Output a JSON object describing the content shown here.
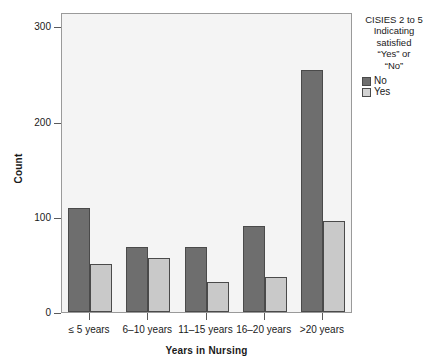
{
  "chart_data": {
    "type": "bar",
    "title": "",
    "categories": [
      "≤ 5 years",
      "6–10 years",
      "11–15 years",
      "16–20 years",
      ">20 years"
    ],
    "series": [
      {
        "name": "No",
        "color": "#6e6e6e",
        "values": [
          109,
          68,
          68,
          90,
          254
        ]
      },
      {
        "name": "Yes",
        "color": "#c9c9c9",
        "values": [
          50,
          57,
          32,
          37,
          96
        ]
      }
    ],
    "xlabel": "Years in Nursing",
    "ylabel": "Count",
    "ylim": [
      0,
      315
    ],
    "yticks": [
      0,
      100,
      200,
      300
    ],
    "ytick_labels": [
      "0",
      "100",
      "200",
      "300"
    ],
    "grid": false,
    "legend_position": "right",
    "legend_title": "CISIES 2 to 5\nIndicating\nsatisfied\n“Yes” or\n“No”"
  },
  "axes": {
    "y_title": "Count",
    "x_title": "Years in Nursing",
    "y_ticks": [
      {
        "label": "300",
        "value": 300
      },
      {
        "label": "200",
        "value": 200
      },
      {
        "label": "100",
        "value": 100
      },
      {
        "label": "0",
        "value": 0
      }
    ],
    "x_ticks": [
      {
        "label": "≤ 5 years"
      },
      {
        "label": "6–10 years"
      },
      {
        "label": "11–15 years"
      },
      {
        "label": "16–20 years"
      },
      {
        "label": ">20 years"
      }
    ]
  },
  "legend": {
    "title": "CISIES 2 to 5\nIndicating\nsatisfied\n“Yes” or\n“No”",
    "items": [
      {
        "label": "No",
        "color": "#6e6e6e"
      },
      {
        "label": "Yes",
        "color": "#d2d2d2"
      }
    ]
  },
  "colors": {
    "plot_background": "#f4f4f4",
    "frame": "#9a9a9a",
    "bar_no": "#6e6e6e",
    "bar_yes": "#c9c9c9",
    "bar_outline": "#4a4a4a",
    "text": "#1a1a1a"
  }
}
